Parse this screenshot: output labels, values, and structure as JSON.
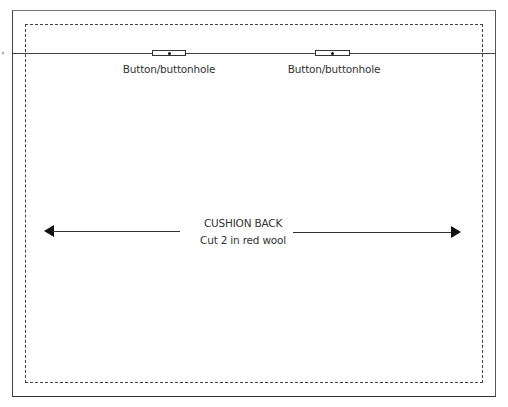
{
  "pattern": {
    "piece_title": "CUSHION BACK",
    "instruction": "Cut 2 in red wool",
    "buttons": [
      {
        "label": "Button/buttonhole",
        "x": 169
      },
      {
        "label": "Button/buttonhole",
        "x": 332
      }
    ],
    "lines": {
      "outer_cut": "solid",
      "seam_allowance": "dashed",
      "fold_line": "solid",
      "grain_line": "double-arrow"
    },
    "colors": {
      "line": "#333333",
      "background": "#ffffff"
    }
  }
}
